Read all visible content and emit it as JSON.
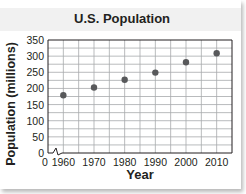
{
  "chart_data": {
    "type": "scatter",
    "title": "U.S. Population",
    "xlabel": "Year",
    "ylabel": "Population (millions)",
    "x": [
      1960,
      1970,
      1980,
      1990,
      2000,
      2010
    ],
    "values": [
      179,
      203,
      227,
      249,
      281,
      309
    ],
    "series": [
      {
        "name": "U.S. Population",
        "x": [
          1960,
          1970,
          1980,
          1990,
          2000,
          2010
        ],
        "values": [
          179,
          203,
          227,
          249,
          281,
          309
        ]
      }
    ],
    "xticks": [
      "1960",
      "1970",
      "1980",
      "1990",
      "2000",
      "2010"
    ],
    "yticks": [
      "0",
      "50",
      "100",
      "150",
      "200",
      "250",
      "300",
      "350"
    ],
    "x_origin_label": "0",
    "x_axis_break": true,
    "ylim": [
      0,
      350
    ],
    "xlim": [
      1955,
      2015
    ],
    "grid": true,
    "legend": "none",
    "colors": {
      "points": "#58595b",
      "grid": "#a7a9ac",
      "border": "#231f20",
      "title_band": "#f1f1f1"
    }
  }
}
